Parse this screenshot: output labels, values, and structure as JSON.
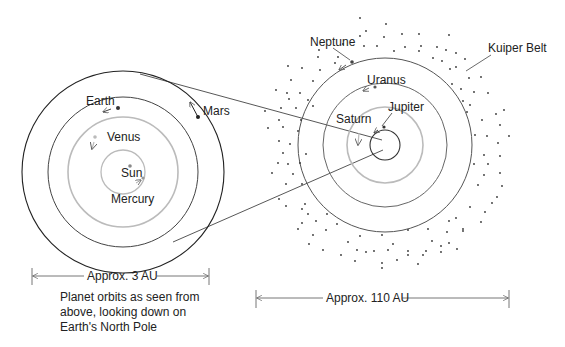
{
  "inner_system": {
    "labels": {
      "earth": "Earth",
      "mars": "Mars",
      "venus": "Venus",
      "sun": "Sun",
      "mercury": "Mercury"
    },
    "scale_label": "Approx. 3 AU",
    "caption": "Planet orbits as seen from above, looking down on Earth's North Pole"
  },
  "outer_system": {
    "labels": {
      "neptune": "Neptune",
      "uranus": "Uranus",
      "jupiter": "Jupiter",
      "saturn": "Saturn",
      "kuiper_belt": "Kuiper Belt"
    },
    "scale_label": "Approx. 110 AU"
  },
  "colors": {
    "line": "#333333",
    "light_orbit": "#b5b5b5",
    "text": "#222222"
  }
}
